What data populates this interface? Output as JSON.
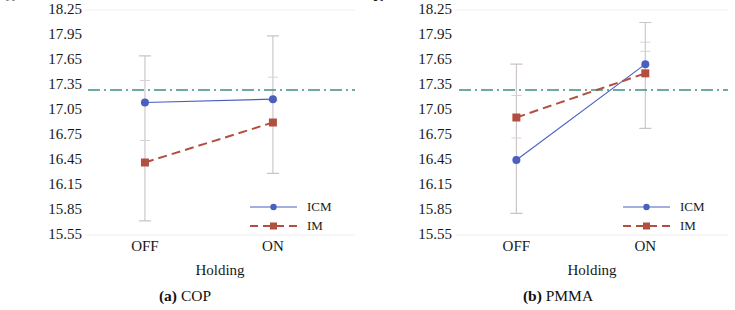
{
  "figure": {
    "panels": [
      {
        "id": "a",
        "caption_number": "(a)",
        "caption_text": "COP",
        "ylabel": "Step Height COP / µm",
        "xlabel": "Holding",
        "xticks": [
          "OFF",
          "ON"
        ],
        "legend": [
          {
            "name": "ICM",
            "color": "#4b5fbf",
            "style": "solid",
            "marker": "circle"
          },
          {
            "name": "IM",
            "color": "#b1503f",
            "style": "dashed",
            "marker": "square"
          }
        ]
      },
      {
        "id": "b",
        "caption_number": "(b)",
        "caption_text": "PMMA",
        "ylabel": "Step Height PMMA / µm",
        "xlabel": "Holding",
        "xticks": [
          "OFF",
          "ON"
        ],
        "legend": [
          {
            "name": "ICM",
            "color": "#4b5fbf",
            "style": "solid",
            "marker": "circle"
          },
          {
            "name": "IM",
            "color": "#b1503f",
            "style": "dashed",
            "marker": "square"
          }
        ]
      }
    ]
  },
  "chart_data": [
    {
      "type": "line",
      "title": "(a) COP",
      "xlabel": "Holding",
      "ylabel": "Step Height COP / µm",
      "categories": [
        "OFF",
        "ON"
      ],
      "ylim": [
        15.55,
        18.25
      ],
      "yticks": [
        18.25,
        17.95,
        17.65,
        17.35,
        17.05,
        16.75,
        16.45,
        16.15,
        15.85,
        15.55
      ],
      "grid": false,
      "legend_position": "lower right",
      "reference_line": {
        "value": 17.29,
        "color": "#3f8f86",
        "style": "dash-dot",
        "label": ""
      },
      "series": [
        {
          "name": "ICM",
          "color": "#4b5fbf",
          "style": "solid",
          "marker": "circle",
          "values": [
            17.14,
            17.18
          ],
          "error_upper": [
            17.7,
            17.94
          ],
          "error_lower": [
            15.72,
            16.29
          ]
        },
        {
          "name": "IM",
          "color": "#b1503f",
          "style": "dashed",
          "marker": "square",
          "values": [
            16.42,
            16.9
          ],
          "error_upper": [
            17.7,
            17.94
          ],
          "error_lower": [
            15.72,
            16.29
          ]
        }
      ]
    },
    {
      "type": "line",
      "title": "(b) PMMA",
      "xlabel": "Holding",
      "ylabel": "Step Height PMMA / µm",
      "categories": [
        "OFF",
        "ON"
      ],
      "ylim": [
        15.55,
        18.25
      ],
      "yticks": [
        18.25,
        17.95,
        17.65,
        17.35,
        17.05,
        16.75,
        16.45,
        16.15,
        15.85,
        15.55
      ],
      "grid": false,
      "legend_position": "lower right",
      "reference_line": {
        "value": 17.29,
        "color": "#3f8f86",
        "style": "dash-dot",
        "label": ""
      },
      "series": [
        {
          "name": "ICM",
          "color": "#4b5fbf",
          "style": "solid",
          "marker": "circle",
          "values": [
            16.45,
            17.6
          ],
          "error_upper": [
            17.6,
            18.1
          ],
          "error_lower": [
            15.81,
            16.83
          ]
        },
        {
          "name": "IM",
          "color": "#b1503f",
          "style": "dashed",
          "marker": "square",
          "values": [
            16.96,
            17.49
          ],
          "error_upper": [
            17.6,
            18.1
          ],
          "error_lower": [
            15.81,
            16.83
          ]
        }
      ]
    }
  ]
}
